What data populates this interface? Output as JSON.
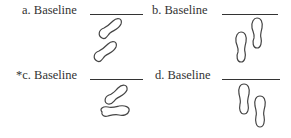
{
  "options": [
    {
      "letter": "a.",
      "marker": "",
      "label": "Baseline",
      "footprints": "diagonal-stacked",
      "correct": false
    },
    {
      "letter": "b.",
      "marker": "",
      "label": "Baseline",
      "footprints": "vertical-staggered-right-forward",
      "correct": false
    },
    {
      "letter": "c.",
      "marker": "*",
      "label": "Baseline",
      "footprints": "diagonal-over-horizontal",
      "correct": true
    },
    {
      "letter": "d.",
      "marker": "",
      "label": "Baseline",
      "footprints": "vertical-staggered-left-forward",
      "correct": false
    }
  ]
}
